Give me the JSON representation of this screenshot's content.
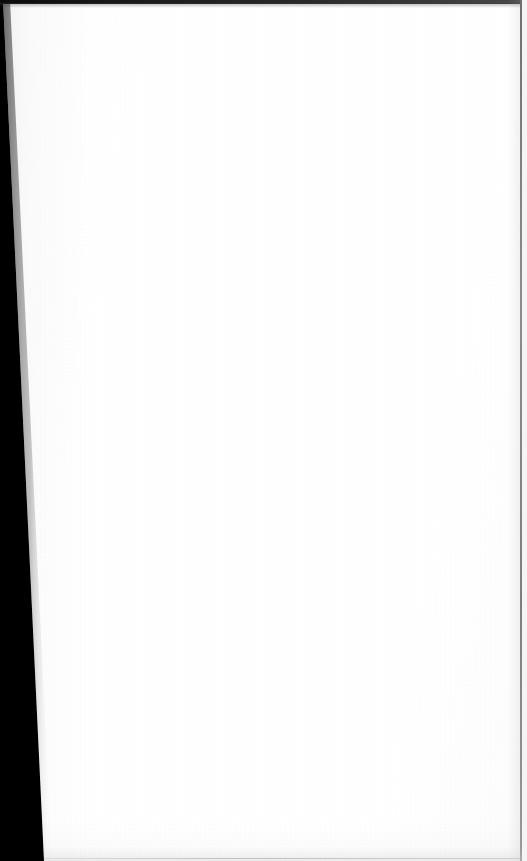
{
  "document": {
    "page_kind": "blank-scanned-leaf",
    "visible_text": "",
    "page_number": "",
    "header_text": "",
    "footer_text": "",
    "body_text": ""
  },
  "scan": {
    "width_px": 527,
    "height_px": 861,
    "paper_color": "#ffffff",
    "paper_tint": "#fdfdfd",
    "gutter_color": "#000000",
    "top_edge_color": "#111111",
    "right_rule_color": "#8c8c8c",
    "bottom_rule_color": "#a5a5a5",
    "outer_margin_color": "#f4f4f4"
  },
  "gutter": {
    "name": "binding-gutter",
    "top_width_px": 2,
    "bottom_width_px": 43,
    "shape": "tapered-wedge"
  },
  "edges": {
    "top_rule_height_px": 4,
    "right_rule_x_px": 520,
    "bottom_rule_y_px": 859
  },
  "annotations": {
    "marks": [],
    "figures": [],
    "captions": []
  }
}
